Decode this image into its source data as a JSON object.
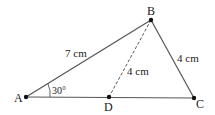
{
  "diagram": {
    "type": "triangle",
    "points": {
      "A": {
        "label": "A",
        "x": 26,
        "y": 97
      },
      "B": {
        "label": "B",
        "x": 151,
        "y": 20
      },
      "C": {
        "label": "C",
        "x": 194,
        "y": 98
      },
      "D": {
        "label": "D",
        "x": 109,
        "y": 97
      }
    },
    "segments": [
      {
        "from": "A",
        "to": "B",
        "style": "solid",
        "label": "7 cm"
      },
      {
        "from": "B",
        "to": "C",
        "style": "solid",
        "label": "4 cm"
      },
      {
        "from": "A",
        "to": "C",
        "style": "solid",
        "label": ""
      },
      {
        "from": "B",
        "to": "D",
        "style": "dashed",
        "label": "4 cm"
      }
    ],
    "angle": {
      "vertex": "A",
      "label": "30°"
    },
    "colors": {
      "line": "#555555",
      "point": "#111111",
      "text": "#222222"
    }
  }
}
